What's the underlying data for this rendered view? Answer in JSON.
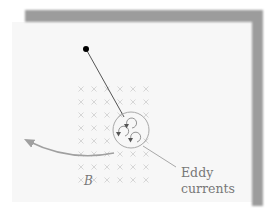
{
  "diagram": {
    "type": "physics-illustration",
    "labels": {
      "field": "B",
      "eddy_line1": "Eddy",
      "eddy_line2": "currents"
    },
    "field_symbol": "×",
    "field_grid": {
      "columns": [
        81,
        94,
        107,
        120,
        133,
        146
      ],
      "rows": [
        89,
        102,
        115,
        128,
        141,
        154,
        167,
        180
      ]
    },
    "pivot": {
      "x": 86,
      "y": 49
    },
    "disk": {
      "cx": 131,
      "cy": 130,
      "r": 18
    },
    "eddy_loops": [
      {
        "cx": 132,
        "cy": 122
      },
      {
        "cx": 125,
        "cy": 130
      },
      {
        "cx": 136,
        "cy": 135
      }
    ],
    "colors": {
      "frame": "#9a9a9a",
      "panel": "#f6f6f6",
      "line": "#555555",
      "field_marks": "#d4d4d4",
      "disk_outline": "#a8a8a8",
      "label": "#777777",
      "pivot": "#000000"
    }
  }
}
